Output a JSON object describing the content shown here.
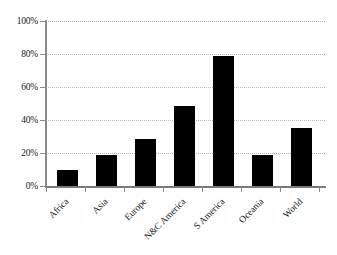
{
  "chart_data": {
    "type": "bar",
    "title": "",
    "subtitle": "",
    "xlabel": "",
    "ylabel": "",
    "categories": [
      "Africa",
      "Asia",
      "Europe",
      "N&C America",
      "S America",
      "Oceania",
      "World"
    ],
    "values": [
      10,
      18.5,
      28.5,
      48.5,
      78.5,
      19,
      35
    ],
    "value_suffix": "%",
    "ylim": [
      0,
      100
    ],
    "ytick_values": [
      0,
      20,
      40,
      60,
      80,
      100
    ],
    "ytick_labels": [
      "0%",
      "20%",
      "40%",
      "60%",
      "80%",
      "100%"
    ],
    "grid": {
      "horizontal": true,
      "vertical": false,
      "style": "dotted",
      "color": "#b8b8b8"
    },
    "legend": {
      "visible": false,
      "position": "none",
      "entries": []
    },
    "series": [
      {
        "name": "",
        "color": "#000000",
        "values": [
          10,
          18.5,
          28.5,
          48.5,
          78.5,
          19,
          35
        ]
      }
    ],
    "annotations": [],
    "axis_color": "#8a8a8a",
    "background_color": "#ffffff",
    "xtick_label_rotation": -45
  }
}
